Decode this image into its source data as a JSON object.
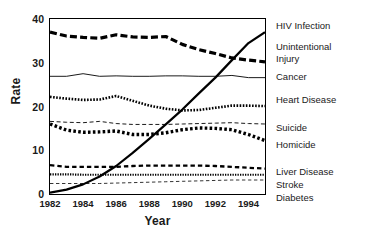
{
  "chart_data": {
    "type": "line",
    "title": "",
    "xlabel": "Year",
    "ylabel": "Rate",
    "xlim": [
      1982,
      1995
    ],
    "ylim": [
      0,
      40
    ],
    "xticks": [
      1982,
      1984,
      1986,
      1988,
      1990,
      1992,
      1994
    ],
    "xtick_labels": [
      "1982",
      "1984",
      "1986",
      "1988",
      "1990",
      "1992",
      "1994"
    ],
    "yticks": [
      0,
      10,
      20,
      30,
      40
    ],
    "ytick_labels": [
      "0",
      "10",
      "20",
      "30",
      "40"
    ],
    "grid": false,
    "legend_position": "right",
    "x": [
      1982,
      1983,
      1984,
      1985,
      1986,
      1987,
      1988,
      1989,
      1990,
      1991,
      1992,
      1993,
      1994,
      1995
    ],
    "series": [
      {
        "name": "HIV Infection",
        "style": "solid-thick",
        "values": [
          0.3,
          1.0,
          2.2,
          4.0,
          6.4,
          9.4,
          12.6,
          15.9,
          19.3,
          23.0,
          26.6,
          30.6,
          34.5,
          37.0
        ]
      },
      {
        "name": "Unintentional Injury",
        "style": "dashed-thick",
        "values": [
          37.0,
          36.1,
          35.8,
          35.6,
          36.4,
          35.9,
          35.8,
          36.0,
          34.2,
          33.0,
          32.1,
          31.1,
          30.6,
          30.2
        ]
      },
      {
        "name": "Cancer",
        "style": "solid-thin",
        "values": [
          26.9,
          26.9,
          27.5,
          26.9,
          27.0,
          26.9,
          26.9,
          27.0,
          27.0,
          26.9,
          26.9,
          27.1,
          26.6,
          26.6
        ]
      },
      {
        "name": "Heart Disease",
        "style": "dotted-medium",
        "values": [
          22.2,
          21.8,
          21.5,
          21.6,
          22.4,
          21.3,
          20.2,
          19.5,
          19.1,
          19.2,
          19.7,
          20.2,
          20.2,
          20.1
        ]
      },
      {
        "name": "Suicide",
        "style": "dashed-thin",
        "values": [
          16.6,
          16.4,
          16.3,
          16.6,
          16.1,
          15.9,
          15.9,
          15.9,
          16.0,
          16.1,
          16.2,
          16.3,
          16.1,
          16.0
        ]
      },
      {
        "name": "Homicide",
        "style": "dotted-thick",
        "values": [
          16.0,
          14.6,
          14.1,
          14.2,
          14.4,
          13.6,
          13.6,
          14.0,
          14.7,
          15.1,
          15.0,
          14.7,
          13.6,
          12.2
        ]
      },
      {
        "name": "Liver Disease",
        "style": "dashed-medium",
        "values": [
          6.6,
          6.2,
          6.2,
          6.2,
          6.2,
          6.4,
          6.5,
          6.5,
          6.5,
          6.5,
          6.4,
          6.2,
          6.0,
          5.8
        ]
      },
      {
        "name": "Stroke",
        "style": "dotted-fine",
        "values": [
          4.5,
          4.5,
          4.4,
          4.4,
          4.4,
          4.4,
          4.4,
          4.4,
          4.4,
          4.4,
          4.4,
          4.4,
          4.4,
          4.4
        ]
      },
      {
        "name": "Diabetes",
        "style": "dashed-fine",
        "values": [
          2.4,
          2.4,
          2.4,
          2.4,
          2.5,
          2.6,
          2.7,
          2.8,
          2.9,
          3.0,
          3.1,
          3.2,
          3.2,
          3.2
        ]
      }
    ]
  },
  "legend": {
    "items": [
      {
        "label": "HIV Infection",
        "label2": ""
      },
      {
        "label": "Unintentional",
        "label2": "Injury"
      },
      {
        "label": "Cancer",
        "label2": ""
      },
      {
        "label": "Heart Disease",
        "label2": ""
      },
      {
        "label": "Suicide",
        "label2": ""
      },
      {
        "label": "Homicide",
        "label2": ""
      },
      {
        "label": "Liver Disease",
        "label2": ""
      },
      {
        "label": "Stroke",
        "label2": ""
      },
      {
        "label": "Diabetes",
        "label2": ""
      }
    ]
  },
  "colors": {
    "ink": "#000000",
    "background": "#ffffff"
  }
}
